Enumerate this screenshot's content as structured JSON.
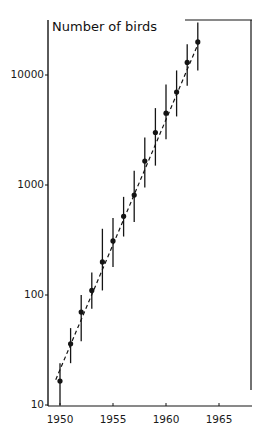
{
  "chart_data": {
    "type": "scatter",
    "title": "",
    "ylabel": "Number of birds",
    "xlabel": "",
    "yscale": "log",
    "ylim": [
      10,
      35000
    ],
    "xlim": [
      1949,
      1968
    ],
    "x_ticks": [
      1950,
      1955,
      1960,
      1965
    ],
    "x_tick_labels": [
      "1950",
      "1955",
      "1960",
      "1965"
    ],
    "y_ticks": [
      10,
      100,
      1000,
      10000
    ],
    "y_tick_labels": [
      "10",
      "100",
      "1000",
      "10000"
    ],
    "grid": false,
    "legend": null,
    "series": [
      {
        "name": "Observed counts",
        "marker": "filled-circle",
        "error_bars": true,
        "x": [
          1950,
          1951,
          1952,
          1953,
          1954,
          1955,
          1956,
          1957,
          1958,
          1959,
          1960,
          1961,
          1962,
          1963
        ],
        "values": [
          16.5,
          36,
          70,
          110,
          200,
          310,
          520,
          810,
          1650,
          3000,
          4500,
          7000,
          13000,
          20000
        ],
        "err_low": [
          10,
          24,
          38,
          75,
          110,
          180,
          340,
          460,
          950,
          1500,
          2600,
          4200,
          8000,
          11000
        ],
        "err_high": [
          24,
          50,
          100,
          160,
          400,
          500,
          780,
          1350,
          2700,
          5000,
          8200,
          11000,
          19000,
          30000
        ]
      },
      {
        "name": "Exponential fit",
        "style": "dashed-line",
        "x": [
          1949.6,
          1963.2
        ],
        "values": [
          17,
          21000
        ]
      }
    ]
  },
  "labels": {
    "y_axis_title": "Number of birds"
  },
  "colors": {
    "ink": "#141414",
    "background": "#ffffff"
  }
}
